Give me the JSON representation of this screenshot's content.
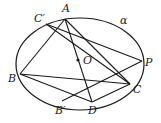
{
  "figure": {
    "ellipse": {
      "cx": 80,
      "cy": 64,
      "rx": 64,
      "ry": 46,
      "label": "α"
    },
    "points": [
      {
        "id": "A",
        "x": 65,
        "y": 19,
        "label": "A",
        "lx": 62,
        "ly": 12
      },
      {
        "id": "C'",
        "x": 46,
        "y": 24,
        "label": "C′",
        "lx": 34,
        "ly": 22
      },
      {
        "id": "P",
        "x": 142,
        "y": 61,
        "label": "P",
        "lx": 145,
        "ly": 66
      },
      {
        "id": "C",
        "x": 130,
        "y": 84,
        "label": "C",
        "lx": 133,
        "ly": 93
      },
      {
        "id": "D",
        "x": 92,
        "y": 102,
        "label": "D",
        "lx": 88,
        "ly": 114
      },
      {
        "id": "B'",
        "x": 62,
        "y": 101,
        "label": "B′",
        "lx": 55,
        "ly": 114
      },
      {
        "id": "B",
        "x": 20,
        "y": 74,
        "label": "B",
        "lx": 8,
        "ly": 82
      },
      {
        "id": "O",
        "x": 78,
        "y": 60,
        "label": "O",
        "lx": 83,
        "ly": 64
      }
    ],
    "segments": [
      [
        "A",
        "B"
      ],
      [
        "A",
        "D"
      ],
      [
        "A",
        "C"
      ],
      [
        "C'",
        "P"
      ],
      [
        "C'",
        "C"
      ],
      [
        "B",
        "D"
      ],
      [
        "B",
        "C"
      ],
      [
        "B'",
        "P"
      ],
      [
        "D",
        "C"
      ]
    ],
    "alpha_label": {
      "text": "α",
      "x": 120,
      "y": 24
    },
    "stroke_color": "#1a1a1a"
  }
}
